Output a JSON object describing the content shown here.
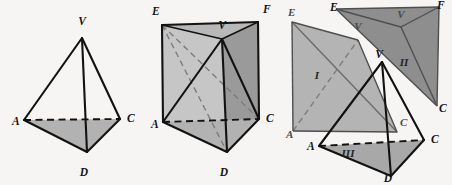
{
  "figure": {
    "caption": "Decomposition of a triangular prism into three tetrahedra",
    "background_color": "#f6f5f3",
    "ink_color": "#121212",
    "panel_count": 3
  },
  "palette": {
    "base_shade": "#b2b2b2",
    "prism_left_face": "#c6c6c6",
    "prism_right_face": "#9a9a9a",
    "prism_top_face": "#b8b8b8",
    "piece_one_fill": "#b4b4b4",
    "piece_two_fill": "#8e8e8e",
    "piece_three_fill": "#a8a8a8",
    "ghost_outline": "#6e6e6e"
  },
  "panels": [
    {
      "id": "panel-1",
      "name": "tetrahedron-VACD",
      "title": "Tetrahedron V-ACD",
      "vertex_labels": [
        {
          "key": "V",
          "text": "V",
          "x": 82,
          "y": 25
        },
        {
          "key": "A",
          "text": "A",
          "x": 12,
          "y": 125
        },
        {
          "key": "C",
          "text": "C",
          "x": 127,
          "y": 122
        },
        {
          "key": "D",
          "text": "D",
          "x": 84,
          "y": 176
        }
      ],
      "points": {
        "V": [
          82,
          38
        ],
        "A": [
          24,
          120
        ],
        "C": [
          120,
          119
        ],
        "D": [
          87,
          152
        ]
      },
      "solid_edges": [
        [
          "V",
          "A"
        ],
        [
          "V",
          "C"
        ],
        [
          "V",
          "D"
        ],
        [
          "A",
          "D"
        ],
        [
          "D",
          "C"
        ]
      ],
      "hidden_edges": [
        [
          "A",
          "C"
        ]
      ],
      "shaded_faces": [
        [
          "A",
          "C",
          "D"
        ]
      ]
    },
    {
      "id": "panel-2",
      "name": "prism-ACD-EVF",
      "title": "Prism with tetrahedron inscribed",
      "vertex_labels": [
        {
          "key": "E",
          "text": "E",
          "x": 152,
          "y": 15
        },
        {
          "key": "F",
          "text": "F",
          "x": 263,
          "y": 13
        },
        {
          "key": "V",
          "text": "V",
          "x": 222,
          "y": 29
        },
        {
          "key": "A",
          "text": "A",
          "x": 151,
          "y": 128
        },
        {
          "key": "C",
          "text": "C",
          "x": 266,
          "y": 122
        },
        {
          "key": "D",
          "text": "D",
          "x": 224,
          "y": 176
        }
      ],
      "points": {
        "E": [
          162,
          25
        ],
        "F": [
          258,
          22
        ],
        "V": [
          222,
          39
        ],
        "A": [
          163,
          122
        ],
        "C": [
          259,
          119
        ],
        "D": [
          227,
          152
        ]
      },
      "solid_edges": [
        [
          "E",
          "F"
        ],
        [
          "E",
          "A"
        ],
        [
          "F",
          "C"
        ],
        [
          "V",
          "D"
        ],
        [
          "A",
          "D"
        ],
        [
          "D",
          "C"
        ],
        [
          "V",
          "A"
        ],
        [
          "V",
          "C"
        ],
        [
          "V",
          "F"
        ],
        [
          "V",
          "E"
        ]
      ],
      "hidden_edges": [
        [
          "A",
          "C"
        ]
      ],
      "ghost_hidden_edges": [
        [
          "E",
          "C"
        ],
        [
          "E",
          "D"
        ]
      ],
      "shaded_faces": [
        [
          "A",
          "C",
          "D"
        ],
        [
          "E",
          "F",
          "V"
        ],
        [
          "E",
          "A",
          "D",
          "V"
        ],
        [
          "F",
          "C",
          "D",
          "V"
        ]
      ]
    },
    {
      "id": "panel-3",
      "name": "exploded-three-tetrahedra",
      "title": "Exploded view: pieces I, II, III",
      "piece_labels": [
        {
          "key": "I",
          "text": "I",
          "x": 317,
          "y": 79
        },
        {
          "key": "II",
          "text": "II",
          "x": 404,
          "y": 66
        },
        {
          "key": "III",
          "text": "III",
          "x": 348,
          "y": 157
        }
      ],
      "vertex_labels": [
        {
          "key": "E-piece-1",
          "text": "E",
          "x": 288,
          "y": 16
        },
        {
          "key": "V-piece-1",
          "text": "V",
          "x": 358,
          "y": 30
        },
        {
          "key": "A-piece-1",
          "text": "A",
          "x": 286,
          "y": 138
        },
        {
          "key": "C-piece-1",
          "text": "C",
          "x": 400,
          "y": 126
        },
        {
          "key": "E-piece-2",
          "text": "E",
          "x": 330,
          "y": 11
        },
        {
          "key": "F-piece-2",
          "text": "F",
          "x": 437,
          "y": 9
        },
        {
          "key": "V-piece-2",
          "text": "V",
          "x": 401,
          "y": 18
        },
        {
          "key": "C-piece-2",
          "text": "C",
          "x": 439,
          "y": 112
        },
        {
          "key": "V-piece-3",
          "text": "V",
          "x": 379,
          "y": 58
        },
        {
          "key": "A-piece-3",
          "text": "A",
          "x": 307,
          "y": 150
        },
        {
          "key": "C-piece-3",
          "text": "C",
          "x": 431,
          "y": 143
        },
        {
          "key": "D-piece-3",
          "text": "D",
          "x": 388,
          "y": 182
        }
      ],
      "piece_one": {
        "name": "tetrahedron-I-EAVC",
        "points": {
          "E": [
            292,
            22
          ],
          "V": [
            358,
            40
          ],
          "A": [
            293,
            131
          ],
          "C": [
            397,
            132
          ]
        },
        "edges": [
          [
            "E",
            "V"
          ],
          [
            "E",
            "A"
          ],
          [
            "V",
            "C"
          ],
          [
            "A",
            "C"
          ],
          [
            "E",
            "C"
          ],
          [
            "A",
            "V"
          ]
        ],
        "hidden_edges": [
          [
            "A",
            "V"
          ]
        ],
        "faces": [
          [
            "E",
            "V",
            "C",
            "A"
          ]
        ]
      },
      "piece_two": {
        "name": "tetrahedron-II-EFVC",
        "points": {
          "E": [
            336,
            9
          ],
          "F": [
            439,
            7
          ],
          "V": [
            401,
            27
          ],
          "C": [
            437,
            106
          ]
        },
        "edges": [
          [
            "E",
            "F"
          ],
          [
            "F",
            "C"
          ],
          [
            "E",
            "C"
          ],
          [
            "V",
            "E"
          ],
          [
            "V",
            "F"
          ],
          [
            "V",
            "C"
          ]
        ],
        "faces": [
          [
            "E",
            "F",
            "C"
          ]
        ]
      },
      "piece_three": {
        "name": "tetrahedron-III-VACD",
        "points": {
          "V": [
            382,
            62
          ],
          "A": [
            319,
            146
          ],
          "C": [
            424,
            140
          ],
          "D": [
            391,
            176
          ]
        },
        "edges": [
          [
            "V",
            "A"
          ],
          [
            "V",
            "C"
          ],
          [
            "V",
            "D"
          ],
          [
            "A",
            "D"
          ],
          [
            "D",
            "C"
          ]
        ],
        "hidden_edges": [
          [
            "A",
            "C"
          ]
        ],
        "faces": [
          [
            "A",
            "C",
            "D"
          ]
        ]
      }
    }
  ]
}
